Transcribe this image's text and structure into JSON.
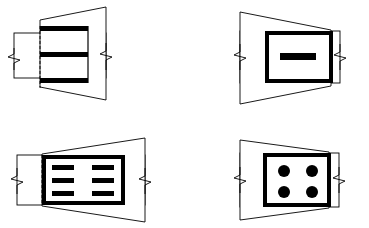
{
  "sheet": {
    "title": "Technical Drawing Sheet",
    "width": 369,
    "height": 228,
    "background_color": "#ffffff",
    "stroke_color": "#000000",
    "fill_color": "#000000",
    "layout": "2x2 grid of patent-style perspective figures",
    "figure_count": 4
  },
  "common": {
    "thin_line_width": 0.8,
    "thick_line_width": 4.0,
    "dashed_pattern": "3,2",
    "break_symbol_name": "zigzag-break-line",
    "description": "Each figure shows a trapezoidal perspective panel overlapping a thin rectangle terminated at both ends by zigzag break lines, with a bold-outlined inner element."
  },
  "figures": [
    {
      "id": "figure-1",
      "position": "top-left",
      "trapezoid": {
        "name": "perspective-panel",
        "orientation": "wider-right",
        "points": "40,20 106,7 106,100 40,87",
        "fill": "#ffffff",
        "stroke": "#000000"
      },
      "thin_rect": {
        "name": "break-rectangle",
        "x": 14,
        "y": 33,
        "width": 92,
        "height": 45,
        "stroke": "#000000"
      },
      "dashed_line": {
        "name": "hidden-edge-dashed-line",
        "side": "left",
        "x": 40,
        "y1": 26,
        "y2": 88
      },
      "inner": {
        "name": "striped-panel",
        "style": "three-horizontal-bars",
        "x": 40,
        "y": 26,
        "width": 48,
        "height": 62,
        "bar_count": 3,
        "bars": [
          {
            "x": 40,
            "y": 26,
            "width": 48,
            "height": 5
          },
          {
            "x": 40,
            "y": 52,
            "width": 48,
            "height": 5
          },
          {
            "x": 40,
            "y": 78,
            "width": 48,
            "height": 5
          }
        ]
      },
      "breaks": [
        {
          "name": "zigzag-break-left",
          "x": 14,
          "y": 56
        },
        {
          "name": "zigzag-break-right",
          "x": 106,
          "y": 56
        }
      ]
    },
    {
      "id": "figure-2",
      "position": "top-right",
      "trapezoid": {
        "name": "perspective-panel",
        "orientation": "wider-left",
        "points": "240,12 331,30 331,86 240,104",
        "fill": "#ffffff",
        "stroke": "#000000"
      },
      "thin_rect": {
        "name": "break-rectangle",
        "x": 240,
        "y": 31,
        "width": 100,
        "height": 52,
        "stroke": "#000000"
      },
      "dashed_line": {
        "name": "hidden-edge-dashed-line",
        "side": "right",
        "x": 331,
        "y1": 31,
        "y2": 83
      },
      "inner": {
        "name": "bold-frame-panel",
        "style": "single-center-bar",
        "x": 265,
        "y": 31,
        "width": 66,
        "height": 52,
        "border_width": 4,
        "bar_count": 1,
        "bars": [
          {
            "x": 280,
            "y": 53,
            "width": 36,
            "height": 7
          }
        ]
      },
      "breaks": [
        {
          "name": "zigzag-break-left",
          "x": 240,
          "y": 57
        },
        {
          "name": "zigzag-break-right",
          "x": 340,
          "y": 57
        }
      ]
    },
    {
      "id": "figure-3",
      "position": "bottom-left",
      "trapezoid": {
        "name": "perspective-panel",
        "orientation": "wider-right",
        "points": "42,154 145,138 145,222 42,206",
        "fill": "#ffffff",
        "stroke": "#000000"
      },
      "thin_rect": {
        "name": "break-rectangle",
        "x": 17,
        "y": 155,
        "width": 128,
        "height": 50,
        "stroke": "#000000"
      },
      "dashed_line": {
        "name": "hidden-edge-dashed-line",
        "side": "left",
        "x": 42,
        "y1": 155,
        "y2": 205
      },
      "inner": {
        "name": "bold-frame-panel",
        "style": "six-bars-two-columns",
        "x": 42,
        "y": 155,
        "width": 83,
        "height": 50,
        "border_width": 4,
        "bar_count": 6,
        "columns": 2,
        "rows": 3,
        "bars": [
          {
            "x": 52,
            "y": 165,
            "width": 22,
            "height": 5
          },
          {
            "x": 92,
            "y": 165,
            "width": 22,
            "height": 5
          },
          {
            "x": 52,
            "y": 178,
            "width": 22,
            "height": 5
          },
          {
            "x": 92,
            "y": 178,
            "width": 22,
            "height": 5
          },
          {
            "x": 52,
            "y": 191,
            "width": 22,
            "height": 5
          },
          {
            "x": 92,
            "y": 191,
            "width": 22,
            "height": 5
          }
        ]
      },
      "breaks": [
        {
          "name": "zigzag-break-left",
          "x": 17,
          "y": 180
        },
        {
          "name": "zigzag-break-right",
          "x": 145,
          "y": 180
        }
      ]
    },
    {
      "id": "figure-4",
      "position": "bottom-right",
      "trapezoid": {
        "name": "perspective-panel",
        "orientation": "wider-left",
        "points": "240,140 329,152 329,208 240,220",
        "fill": "#ffffff",
        "stroke": "#000000"
      },
      "thin_rect": {
        "name": "break-rectangle",
        "x": 240,
        "y": 153,
        "width": 99,
        "height": 54,
        "stroke": "#000000"
      },
      "dashed_line": {
        "name": "hidden-edge-dashed-line",
        "side": "right",
        "x": 329,
        "y1": 153,
        "y2": 207
      },
      "inner": {
        "name": "bold-frame-panel",
        "style": "four-dots-grid",
        "x": 263,
        "y": 153,
        "width": 66,
        "height": 54,
        "border_width": 4,
        "dot_count": 4,
        "columns": 2,
        "rows": 2,
        "dots": [
          {
            "cx": 284,
            "cy": 171,
            "r": 6
          },
          {
            "cx": 312,
            "cy": 171,
            "r": 6
          },
          {
            "cx": 284,
            "cy": 192,
            "r": 6
          },
          {
            "cx": 312,
            "cy": 192,
            "r": 6
          }
        ]
      },
      "breaks": [
        {
          "name": "zigzag-break-left",
          "x": 240,
          "y": 179
        },
        {
          "name": "zigzag-break-right",
          "x": 339,
          "y": 179
        }
      ]
    }
  ]
}
